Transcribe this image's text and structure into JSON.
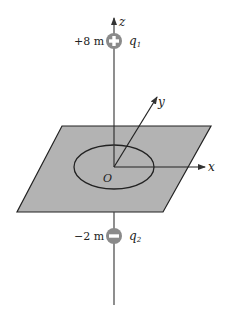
{
  "figure": {
    "axes": {
      "z": "z",
      "y": "y",
      "x": "x",
      "origin": "O"
    },
    "charges": [
      {
        "position": "+8 m",
        "name": "q",
        "subscript": "1",
        "sign": "+"
      },
      {
        "position": "−2 m",
        "name": "q",
        "subscript": "2",
        "sign": "−"
      }
    ],
    "colors": {
      "plane": "#b3b3b3",
      "charge": "#8a8a8a",
      "line": "#333333"
    }
  }
}
